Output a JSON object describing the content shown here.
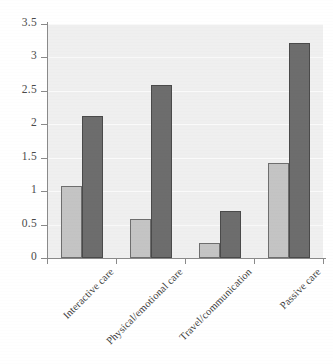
{
  "chart_data": {
    "type": "bar",
    "title": "",
    "subtitle": "",
    "xlabel": "",
    "ylabel": "",
    "categories": [
      "Interactive care",
      "Physical/emotional care",
      "Travel/communication",
      "Passive care"
    ],
    "series": [
      {
        "name": "series-1",
        "color": "#c4c4c4",
        "values": [
          1.07,
          0.59,
          0.22,
          1.42
        ]
      },
      {
        "name": "series-2",
        "color": "#6d6d6d",
        "values": [
          2.12,
          2.59,
          0.71,
          3.21
        ]
      }
    ],
    "ylim": [
      0,
      3.5
    ],
    "yticks": [
      0,
      0.5,
      1,
      1.5,
      2,
      2.5,
      3,
      3.5
    ],
    "ytick_labels": [
      "0",
      "0.5",
      "1",
      "1.5",
      "2",
      "2.5",
      "3",
      "3.5"
    ],
    "grid": true,
    "grid_axis": "y",
    "legend": "none",
    "plot_background": "#efefef",
    "figure_background": "#ffffff",
    "axis_color": "#8a8a8a",
    "tick_label_color": "#4a4a4a"
  }
}
